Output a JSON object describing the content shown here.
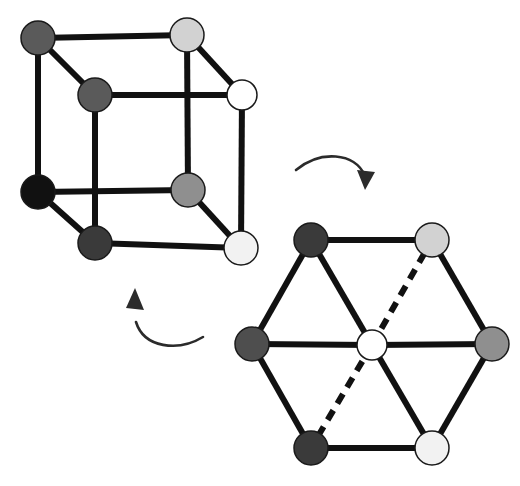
{
  "figure": {
    "background_color": "#ffffff",
    "edge_color": "#111111",
    "edge_width": 6,
    "vertex_outline_color": "#1a1a1a",
    "vertex_outline_width": 1.5,
    "vertex_radius": 16,
    "labels": {
      "cube_name": "cube-diagram",
      "hexagon_name": "hexagon-diagram",
      "top_arrow_name": "arrow-cube-to-hexagon",
      "bottom_arrow_name": "arrow-hexagon-to-cube"
    }
  },
  "palette": {
    "black": "#111111",
    "dark_gray": "#3a3a3a",
    "mid_dark_gray": "#4e4e4e",
    "mid_gray": "#5a5a5a",
    "gray": "#8f8f8f",
    "light_gray": "#d2d2d2",
    "near_white": "#f2f2f2",
    "white": "#ffffff",
    "stroke": "#111111",
    "arrow": "#2b2b2b"
  },
  "cube": {
    "name": "cube-diagram",
    "vertices": [
      {
        "id": "c-back-top-left",
        "x": 38,
        "y": 38,
        "fill": "#5a5a5a",
        "r": 17,
        "label": "back-top-left"
      },
      {
        "id": "c-back-top-right",
        "x": 187,
        "y": 35,
        "fill": "#d2d2d2",
        "r": 17,
        "label": "back-top-right"
      },
      {
        "id": "c-back-bottom-left",
        "x": 38,
        "y": 192,
        "fill": "#111111",
        "r": 17,
        "label": "back-bottom-left"
      },
      {
        "id": "c-back-bottom-right",
        "x": 188,
        "y": 190,
        "fill": "#8f8f8f",
        "r": 17,
        "label": "back-bottom-right"
      },
      {
        "id": "c-front-top-left",
        "x": 95,
        "y": 95,
        "fill": "#5a5a5a",
        "r": 17,
        "label": "front-top-left"
      },
      {
        "id": "c-front-top-right",
        "x": 242,
        "y": 95,
        "fill": "#ffffff",
        "r": 15,
        "label": "front-top-right-open"
      },
      {
        "id": "c-front-bottom-left",
        "x": 95,
        "y": 243,
        "fill": "#3a3a3a",
        "r": 17,
        "label": "front-bottom-left"
      },
      {
        "id": "c-front-bottom-right",
        "x": 241,
        "y": 248,
        "fill": "#f2f2f2",
        "r": 17,
        "label": "front-bottom-right"
      }
    ],
    "edges": [
      {
        "from": "c-back-top-left",
        "to": "c-back-top-right",
        "style": "solid",
        "label": "back-top"
      },
      {
        "from": "c-back-top-left",
        "to": "c-back-bottom-left",
        "style": "solid",
        "label": "back-left"
      },
      {
        "from": "c-back-top-right",
        "to": "c-back-bottom-right",
        "style": "solid",
        "label": "back-right"
      },
      {
        "from": "c-back-bottom-left",
        "to": "c-back-bottom-right",
        "style": "solid",
        "label": "back-bottom"
      },
      {
        "from": "c-front-top-left",
        "to": "c-front-top-right",
        "style": "solid",
        "label": "front-top"
      },
      {
        "from": "c-front-top-left",
        "to": "c-front-bottom-left",
        "style": "solid",
        "label": "front-left"
      },
      {
        "from": "c-front-top-right",
        "to": "c-front-bottom-right",
        "style": "solid",
        "label": "front-right"
      },
      {
        "from": "c-front-bottom-left",
        "to": "c-front-bottom-right",
        "style": "solid",
        "label": "front-bottom"
      },
      {
        "from": "c-back-top-left",
        "to": "c-front-top-left",
        "style": "solid",
        "label": "connect-top-left"
      },
      {
        "from": "c-back-top-right",
        "to": "c-front-top-right",
        "style": "solid",
        "label": "connect-top-right"
      },
      {
        "from": "c-back-bottom-left",
        "to": "c-front-bottom-left",
        "style": "solid",
        "label": "connect-bottom-left"
      },
      {
        "from": "c-back-bottom-right",
        "to": "c-front-bottom-right",
        "style": "solid",
        "label": "connect-bottom-right"
      }
    ]
  },
  "hexagon": {
    "name": "hexagon-diagram",
    "center": {
      "x": 372,
      "y": 345
    },
    "vertices": [
      {
        "id": "h-top-left",
        "x": 311,
        "y": 240,
        "fill": "#3a3a3a",
        "r": 17,
        "label": "top-left"
      },
      {
        "id": "h-top-right",
        "x": 432,
        "y": 240,
        "fill": "#d2d2d2",
        "r": 17,
        "label": "top-right"
      },
      {
        "id": "h-right",
        "x": 492,
        "y": 344,
        "fill": "#8f8f8f",
        "r": 17,
        "label": "right"
      },
      {
        "id": "h-bottom-right",
        "x": 432,
        "y": 448,
        "fill": "#f2f2f2",
        "r": 17,
        "label": "bottom-right"
      },
      {
        "id": "h-bottom-left",
        "x": 311,
        "y": 448,
        "fill": "#3a3a3a",
        "r": 17,
        "label": "bottom-left"
      },
      {
        "id": "h-left",
        "x": 252,
        "y": 344,
        "fill": "#4e4e4e",
        "r": 17,
        "label": "left"
      },
      {
        "id": "h-center",
        "x": 372,
        "y": 345,
        "fill": "#ffffff",
        "r": 15,
        "label": "center-open"
      }
    ],
    "edges": [
      {
        "from": "h-top-left",
        "to": "h-top-right",
        "style": "solid",
        "label": "perimeter-top"
      },
      {
        "from": "h-top-right",
        "to": "h-right",
        "style": "solid",
        "label": "perimeter-upper-right"
      },
      {
        "from": "h-right",
        "to": "h-bottom-right",
        "style": "solid",
        "label": "perimeter-lower-right"
      },
      {
        "from": "h-bottom-right",
        "to": "h-bottom-left",
        "style": "solid",
        "label": "perimeter-bottom"
      },
      {
        "from": "h-bottom-left",
        "to": "h-left",
        "style": "solid",
        "label": "perimeter-lower-left"
      },
      {
        "from": "h-left",
        "to": "h-top-left",
        "style": "solid",
        "label": "perimeter-upper-left"
      },
      {
        "from": "h-center",
        "to": "h-left",
        "style": "solid",
        "label": "spoke-left"
      },
      {
        "from": "h-center",
        "to": "h-right",
        "style": "solid",
        "label": "spoke-right"
      },
      {
        "from": "h-center",
        "to": "h-top-left",
        "style": "solid",
        "label": "spoke-upper-left"
      },
      {
        "from": "h-center",
        "to": "h-bottom-right",
        "style": "solid",
        "label": "spoke-lower-right"
      },
      {
        "from": "h-center",
        "to": "h-top-right",
        "style": "dashed",
        "label": "spoke-upper-right-hidden"
      },
      {
        "from": "h-center",
        "to": "h-bottom-left",
        "style": "dashed",
        "label": "spoke-lower-left-hidden"
      }
    ],
    "dash_pattern": "11 8"
  },
  "arrows": [
    {
      "id": "arrow-top",
      "label": "arrow-cube-to-hexagon",
      "path": "M 296 170 C 320 150 355 152 365 176",
      "head": "M 365 190 L 357 170 L 375 172 Z",
      "color": "#2b2b2b",
      "width": 2.6
    },
    {
      "id": "arrow-bottom",
      "label": "arrow-hexagon-to-cube",
      "path": "M 203 337 C 178 352 144 348 136 322",
      "head": "M 135 288 L 144 310 L 126 308 Z",
      "color": "#2b2b2b",
      "width": 2.6
    }
  ]
}
